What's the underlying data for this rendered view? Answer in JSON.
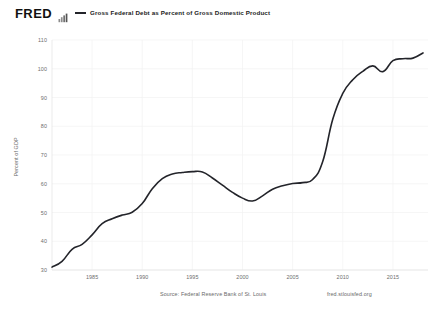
{
  "header": {
    "logo_text": "FRED",
    "logo_icon": "bar-chart-icon",
    "legend": {
      "label": "Gross Federal Debt as Percent of Gross Domestic Product",
      "color": "#23242a"
    }
  },
  "footer": {
    "source": "Source: Federal Reserve Bank of St. Louis",
    "url": "fred.stlouisfed.org"
  },
  "chart_data": {
    "type": "line",
    "title": "Gross Federal Debt as Percent of Gross Domestic Product",
    "xlabel": "",
    "ylabel": "Percent of GDP",
    "xlim": [
      1981,
      2018.5
    ],
    "ylim": [
      30,
      110
    ],
    "xticks": [
      1985,
      1990,
      1995,
      2000,
      2005,
      2010,
      2015
    ],
    "xtick_labels": [
      "1985",
      "1990",
      "1995",
      "2000",
      "2005",
      "2010",
      "2015"
    ],
    "yticks": [
      30,
      40,
      50,
      60,
      70,
      80,
      90,
      100,
      110
    ],
    "ytick_labels": [
      "30",
      "40",
      "50",
      "60",
      "70",
      "80",
      "90",
      "100",
      "110"
    ],
    "grid": true,
    "grid_color": "#f2f2f2",
    "legend_position": "top",
    "line_color": "#23242a",
    "line_width": 1.6,
    "series": [
      {
        "name": "Gross Federal Debt as Percent of Gross Domestic Product",
        "x": [
          1981,
          1982,
          1983,
          1984,
          1985,
          1986,
          1987,
          1988,
          1989,
          1990,
          1991,
          1992,
          1993,
          1994,
          1995,
          1996,
          1997,
          1998,
          1999,
          2000,
          2001,
          2002,
          2003,
          2004,
          2005,
          2006,
          2007,
          2008,
          2009,
          2010,
          2011,
          2012,
          2013,
          2014,
          2015,
          2016,
          2017,
          2018
        ],
        "values": [
          31.0,
          33.0,
          37.2,
          38.9,
          42.2,
          46.1,
          47.8,
          49.1,
          50.1,
          53.1,
          58.3,
          61.8,
          63.4,
          63.9,
          64.2,
          64.1,
          62.0,
          59.5,
          57.0,
          55.0,
          54.0,
          55.8,
          58.1,
          59.3,
          60.1,
          60.4,
          61.5,
          67.7,
          82.4,
          91.4,
          96.2,
          99.1,
          101.0,
          99.0,
          102.8,
          103.5,
          103.7,
          105.5
        ]
      }
    ]
  },
  "plot_geometry": {
    "left": 52,
    "right": 428,
    "top": 40,
    "bottom": 270
  }
}
